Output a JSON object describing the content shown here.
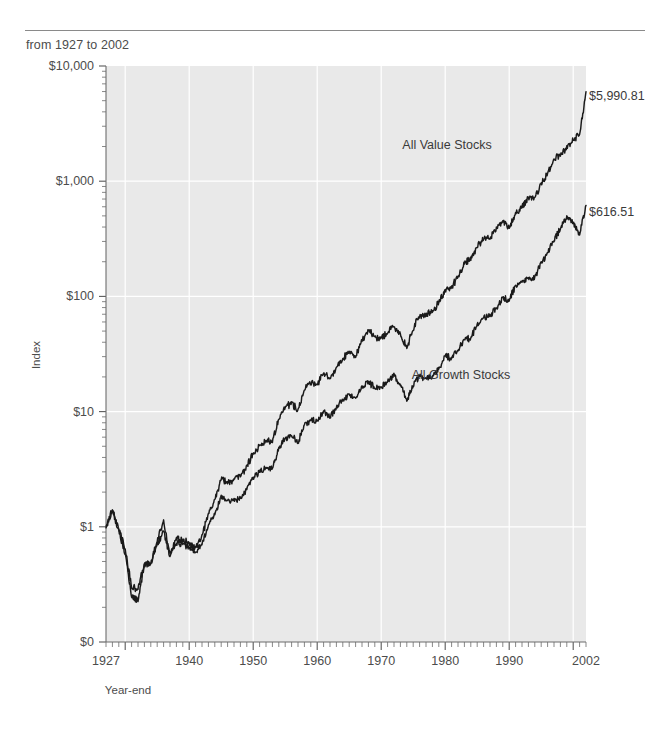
{
  "header": {
    "caption": "from 1927 to 2002"
  },
  "chart_data": {
    "type": "line",
    "title": "",
    "subtitle": "from 1927 to 2002",
    "xlabel": "Year-end",
    "ylabel": "Index",
    "yscale": "log",
    "ylim": [
      0.1,
      10000
    ],
    "xlim": [
      1927,
      2002
    ],
    "grid": true,
    "legend_position": "inline-annotation",
    "ytick_labels": [
      "$10,000",
      "$1,000",
      "$100",
      "$10",
      "$1",
      "$0"
    ],
    "ytick_values": [
      10000,
      1000,
      100,
      10,
      1,
      0.1
    ],
    "xtick_labels": [
      "1927",
      "1940",
      "1950",
      "1960",
      "1970",
      "1980",
      "1990",
      "2002"
    ],
    "xtick_values": [
      1927,
      1940,
      1950,
      1960,
      1970,
      1980,
      1990,
      2002
    ],
    "x": [
      1927,
      1928,
      1929,
      1930,
      1931,
      1932,
      1933,
      1934,
      1935,
      1936,
      1937,
      1938,
      1939,
      1940,
      1941,
      1942,
      1943,
      1944,
      1945,
      1946,
      1947,
      1948,
      1949,
      1950,
      1951,
      1952,
      1953,
      1954,
      1955,
      1956,
      1957,
      1958,
      1959,
      1960,
      1961,
      1962,
      1963,
      1964,
      1965,
      1966,
      1967,
      1968,
      1969,
      1970,
      1971,
      1972,
      1973,
      1974,
      1975,
      1976,
      1977,
      1978,
      1979,
      1980,
      1981,
      1982,
      1983,
      1984,
      1985,
      1986,
      1987,
      1988,
      1989,
      1990,
      1991,
      1992,
      1993,
      1994,
      1995,
      1996,
      1997,
      1998,
      1999,
      2000,
      2001,
      2002
    ],
    "series": [
      {
        "name": "All Value Stocks",
        "end_label": "$5,990.81",
        "end_value": 5990.81,
        "color": "#1a1a1a",
        "values": [
          1.0,
          1.42,
          0.93,
          0.58,
          0.25,
          0.23,
          0.46,
          0.48,
          0.76,
          1.12,
          0.58,
          0.79,
          0.76,
          0.72,
          0.66,
          0.84,
          1.28,
          1.72,
          2.62,
          2.43,
          2.58,
          2.78,
          3.34,
          4.35,
          5.05,
          5.63,
          5.52,
          8.78,
          10.9,
          11.9,
          10.3,
          15.8,
          17.6,
          17.2,
          21.2,
          19.3,
          24.2,
          28.4,
          33.6,
          30.1,
          41.6,
          50.8,
          44.2,
          43.6,
          48.5,
          54.6,
          47.2,
          35.8,
          51.8,
          68.2,
          68.9,
          73.8,
          89.5,
          113.0,
          120.0,
          148.0,
          196.0,
          210.0,
          272.0,
          318.0,
          321.0,
          390.0,
          443.0,
          400.0,
          523.0,
          607.0,
          714.0,
          721.0,
          947.0,
          1180.0,
          1550.0,
          1680.0,
          1980.0,
          2320.0,
          2480.0,
          5990.81
        ]
      },
      {
        "name": "All Growth Stocks",
        "end_label": "$616.51",
        "end_value": 616.51,
        "color": "#1a1a1a",
        "values": [
          1.0,
          1.38,
          0.97,
          0.64,
          0.3,
          0.29,
          0.48,
          0.47,
          0.7,
          0.92,
          0.55,
          0.72,
          0.71,
          0.66,
          0.59,
          0.71,
          1.02,
          1.28,
          1.83,
          1.67,
          1.72,
          1.78,
          2.11,
          2.65,
          3.03,
          3.31,
          3.21,
          4.86,
          5.84,
          6.18,
          5.36,
          7.71,
          8.42,
          8.3,
          10.1,
          8.93,
          10.9,
          12.5,
          14.3,
          12.8,
          16.4,
          18.1,
          16.1,
          16.2,
          18.4,
          21.0,
          17.2,
          12.4,
          16.9,
          20.6,
          19.2,
          20.1,
          23.6,
          30.6,
          28.8,
          34.3,
          41.8,
          43.5,
          57.0,
          66.1,
          68.2,
          78.3,
          97.4,
          93.1,
          124.0,
          132.0,
          142.0,
          145.0,
          196.0,
          238.0,
          305.0,
          390.0,
          489.0,
          436.0,
          344.0,
          616.51
        ]
      }
    ],
    "annotations": [
      {
        "text": "All Value Stocks",
        "x": 1983,
        "y_px": 145
      },
      {
        "text": "All Growth Stocks",
        "x": 1985,
        "y_px": 375
      }
    ]
  }
}
